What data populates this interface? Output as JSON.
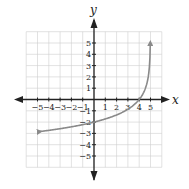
{
  "chart_data": {
    "type": "line",
    "title": "",
    "xlabel": "x",
    "ylabel": "y",
    "xlim": [
      -6,
      6
    ],
    "ylim": [
      -6,
      6
    ],
    "grid": true,
    "x_ticks": [
      "−5",
      "−4",
      "−3",
      "−2",
      "−1",
      "1",
      "2",
      "3",
      "4",
      "5"
    ],
    "y_ticks": [
      "5",
      "4",
      "3",
      "2",
      "1",
      "−1",
      "−2",
      "−3",
      "−4",
      "−5"
    ],
    "series": [
      {
        "name": "curve",
        "color": "#8a8a8a",
        "description": "increasing logarithmic-type curve with vertical asymptote at x = 5, passing through (0, -2) and (4, 0), arrows at both ends",
        "x": [
          -4.8,
          -4,
          -3,
          -2,
          -1,
          0,
          1,
          2,
          3,
          4,
          4.5,
          4.8,
          4.95
        ],
        "y": [
          -2.85,
          -2.73,
          -2.58,
          -2.42,
          -2.23,
          -2.0,
          -1.72,
          -1.37,
          -0.86,
          0.0,
          0.86,
          2.0,
          3.72
        ]
      }
    ],
    "key_points": [
      {
        "x": 0,
        "y": -2
      },
      {
        "x": 4,
        "y": 0
      }
    ],
    "end_arrows": [
      {
        "x": -4.8,
        "y": -2.9
      },
      {
        "x": 4.95,
        "y": 5
      }
    ]
  }
}
